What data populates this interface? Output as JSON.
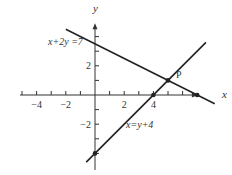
{
  "diagram": {
    "axes": {
      "x_label": "x",
      "y_label": "y",
      "x_range": [
        -5,
        6.5
      ],
      "y_range": [
        -5,
        4.5
      ],
      "x_ticks": [
        -5,
        -4,
        -3,
        -2,
        -1,
        1,
        2,
        3,
        4,
        5,
        6
      ],
      "y_ticks": [
        -4,
        -3,
        -2,
        -1,
        1,
        2,
        3,
        4
      ],
      "x_tick_labels": [
        {
          "value": -4,
          "text": "−4"
        },
        {
          "value": -2,
          "text": "−2"
        },
        {
          "value": 2,
          "text": "2"
        },
        {
          "value": 4,
          "text": "4"
        }
      ],
      "y_tick_labels": [
        {
          "value": 2,
          "text": "2"
        },
        {
          "value": -2,
          "text": "−2"
        }
      ]
    },
    "lines": [
      {
        "name": "line-x-plus-2y-eq-7",
        "equation": "x+2y =7",
        "a": 1,
        "b": 2,
        "c": 7,
        "x_from": -2,
        "x_to": 8.2
      },
      {
        "name": "line-x-eq-y-plus-4",
        "equation": "x=y+4",
        "a": 1,
        "b": -1,
        "c": 4,
        "x_from": -0.6,
        "x_to": 7.6
      }
    ],
    "points": [
      {
        "name": "P",
        "label": "P",
        "x": 5,
        "y": 1
      },
      {
        "name": "x-intercept-line1",
        "label": "",
        "x": 7,
        "y": 0
      },
      {
        "name": "x-intercept-line2",
        "label": "",
        "x": 4,
        "y": 0
      },
      {
        "name": "y-intercept-line2",
        "label": "",
        "x": 0,
        "y": -4
      }
    ],
    "labels": {
      "line1": "x+2y =7",
      "line2": "x=y+4",
      "point_p": "P"
    },
    "colors": {
      "line": "#222222",
      "axis": "#333333"
    }
  }
}
